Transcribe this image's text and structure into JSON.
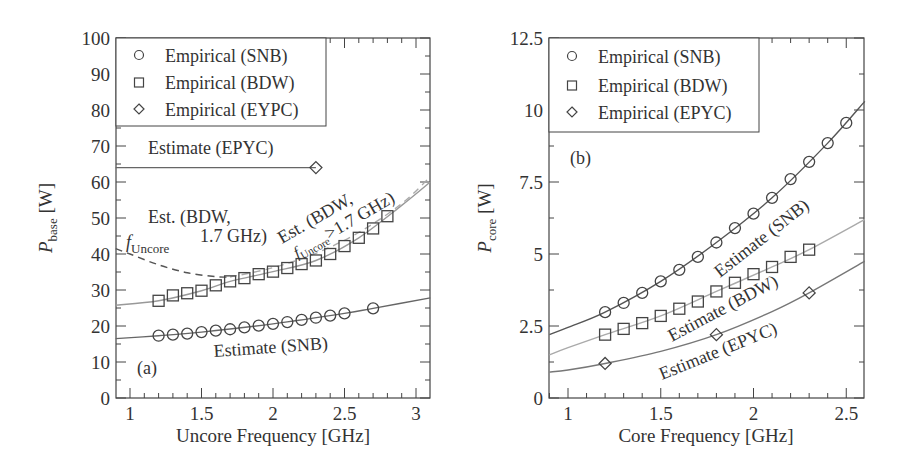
{
  "figure": {
    "panels": [
      "(a)",
      "(b)"
    ]
  },
  "chart_data": [
    {
      "type": "scatter",
      "panel_label": "(a)",
      "xlabel": "Uncore Frequency [GHz]",
      "ylabel": "P_base [W]",
      "ylabel_main": "P",
      "ylabel_sub": "base",
      "ylabel_unit": "[W]",
      "xlim": [
        0.9,
        3.1
      ],
      "ylim": [
        0,
        100
      ],
      "xticks": [
        1,
        1.5,
        2,
        2.5,
        3
      ],
      "xtick_labels": [
        "1",
        "1.5",
        "2",
        "2.5",
        "3"
      ],
      "yticks": [
        0,
        10,
        20,
        30,
        40,
        50,
        60,
        70,
        80,
        90,
        100
      ],
      "ytick_labels": [
        "0",
        "10",
        "20",
        "30",
        "40",
        "50",
        "60",
        "70",
        "80",
        "90",
        "100"
      ],
      "grid": false,
      "legend": {
        "position": "upper-left",
        "entries": [
          {
            "marker": "circle",
            "label": "Empirical (SNB)"
          },
          {
            "marker": "square",
            "label": "Empirical (BDW)"
          },
          {
            "marker": "diamond",
            "label": "Empirical (EYPC)"
          }
        ]
      },
      "series": [
        {
          "name": "Empirical (SNB)",
          "marker": "circle",
          "x": [
            1.2,
            1.3,
            1.4,
            1.5,
            1.6,
            1.7,
            1.8,
            1.9,
            2.0,
            2.1,
            2.2,
            2.3,
            2.4,
            2.5,
            2.7
          ],
          "y": [
            17.3,
            17.6,
            17.9,
            18.3,
            18.7,
            19.1,
            19.6,
            20.1,
            20.6,
            21.1,
            21.7,
            22.3,
            22.9,
            23.5,
            24.9
          ]
        },
        {
          "name": "Empirical (BDW)",
          "marker": "square",
          "x": [
            1.2,
            1.3,
            1.4,
            1.5,
            1.6,
            1.7,
            1.8,
            1.9,
            2.0,
            2.1,
            2.2,
            2.3,
            2.4,
            2.5,
            2.6,
            2.7,
            2.8
          ],
          "y": [
            27.0,
            28.5,
            29.1,
            29.8,
            31.3,
            32.4,
            33.3,
            34.4,
            35.1,
            36.1,
            37.2,
            38.2,
            40.0,
            42.2,
            44.5,
            47.1,
            50.5
          ]
        },
        {
          "name": "Empirical (EYPC)",
          "marker": "diamond",
          "x": [
            2.3
          ],
          "y": [
            64
          ]
        },
        {
          "name": "Estimate (SNB)",
          "style": "solid",
          "color": "#666666",
          "x": [
            0.9,
            1.2,
            1.5,
            2.0,
            2.5,
            2.7,
            3.1
          ],
          "y": [
            16.5,
            17.3,
            18.3,
            20.6,
            23.5,
            24.9,
            27.8
          ]
        },
        {
          "name": "Est. (BDW, > 1.7 GHz) fit",
          "style": "solid-light",
          "color": "#999999",
          "x": [
            0.9,
            1.2,
            1.5,
            1.7,
            2.0,
            2.3,
            2.6,
            2.9,
            3.1
          ],
          "y": [
            25.8,
            27.0,
            29.8,
            32.4,
            35.1,
            38.2,
            44.5,
            53.5,
            60.0
          ]
        },
        {
          "name": "Est. (BDW, <= 1.7 GHz) dashed",
          "style": "dashed",
          "color": "#555555",
          "x": [
            0.9,
            1.0,
            1.2,
            1.4,
            1.6,
            1.7
          ],
          "y": [
            41.5,
            40.0,
            37.0,
            34.8,
            33.7,
            33.6
          ]
        },
        {
          "name": "Est. (BDW, > 1.7 GHz) dashed",
          "style": "dashed-light",
          "color": "#aaaaaa",
          "x": [
            1.7,
            2.0,
            2.3,
            2.6,
            2.9,
            3.1
          ],
          "y": [
            33.6,
            36.2,
            40.2,
            46.0,
            54.0,
            61.5
          ]
        },
        {
          "name": "Estimate (EPYC)",
          "style": "solid",
          "color": "#666666",
          "x": [
            0.9,
            2.3
          ],
          "y": [
            64,
            64
          ]
        }
      ],
      "annotations": [
        {
          "text": "Estimate (EPYC)",
          "x": 1.5,
          "y": 69
        },
        {
          "text": "Est. (BDW,",
          "x": 1.5,
          "y": 48
        },
        {
          "text": "1.7 GHz)",
          "x": 1.6,
          "y": 43
        },
        {
          "text": "f_Uncore",
          "x": 1.05,
          "y": 43
        },
        {
          "text": "Est. (BDW, >1.7 GHz) f_Uncore",
          "x": 2.5,
          "y": 50,
          "rotation": -30
        },
        {
          "text": "Estimate (SNB)",
          "x": 2.0,
          "y": 13
        }
      ],
      "labels": {
        "est_epyc": "Estimate (EPYC)",
        "est_bdw_low_1": "Est. (BDW,",
        "est_bdw_low_2": "1.7 GHz)",
        "f_main": "f",
        "f_sub": "Uncore",
        "est_bdw_high_1": "Est. (BDW,",
        "est_bdw_high_2": ">1.7 GHz)",
        "est_snb": "Estimate (SNB)"
      }
    },
    {
      "type": "scatter",
      "panel_label": "(b)",
      "xlabel": "Core Frequency [GHz]",
      "ylabel": "P_core [W]",
      "ylabel_main": "P",
      "ylabel_sub": "core",
      "ylabel_unit": "[W]",
      "xlim": [
        0.9,
        2.6
      ],
      "ylim": [
        0,
        12.5
      ],
      "xticks": [
        1,
        1.5,
        2,
        2.5
      ],
      "xtick_labels": [
        "1",
        "1.5",
        "2",
        "2.5"
      ],
      "yticks": [
        0,
        2.5,
        5,
        7.5,
        10,
        12.5
      ],
      "ytick_labels": [
        "0",
        "2.5",
        "5",
        "7.5",
        "10",
        "12.5"
      ],
      "grid": false,
      "legend": {
        "position": "upper-left",
        "entries": [
          {
            "marker": "circle",
            "label": "Empirical (SNB)"
          },
          {
            "marker": "square",
            "label": "Empirical (BDW)"
          },
          {
            "marker": "diamond",
            "label": "Empirical (EPYC)"
          }
        ]
      },
      "series": [
        {
          "name": "Empirical (SNB)",
          "marker": "circle",
          "x": [
            1.2,
            1.3,
            1.4,
            1.5,
            1.6,
            1.7,
            1.8,
            1.9,
            2.0,
            2.1,
            2.2,
            2.3,
            2.4,
            2.5
          ],
          "y": [
            2.98,
            3.3,
            3.65,
            4.05,
            4.45,
            4.9,
            5.4,
            5.9,
            6.4,
            6.95,
            7.6,
            8.2,
            8.85,
            9.55
          ]
        },
        {
          "name": "Empirical (BDW)",
          "marker": "square",
          "x": [
            1.2,
            1.3,
            1.4,
            1.5,
            1.6,
            1.7,
            1.8,
            1.9,
            2.0,
            2.1,
            2.2,
            2.3
          ],
          "y": [
            2.2,
            2.4,
            2.6,
            2.85,
            3.1,
            3.35,
            3.7,
            4.0,
            4.3,
            4.55,
            4.9,
            5.15
          ]
        },
        {
          "name": "Empirical (EPYC)",
          "marker": "diamond",
          "x": [
            1.2,
            1.8,
            2.3
          ],
          "y": [
            1.2,
            2.2,
            3.65
          ]
        },
        {
          "name": "Estimate (SNB)",
          "style": "solid",
          "color": "#555555",
          "x": [
            0.9,
            1.0,
            1.2,
            1.5,
            1.8,
            2.1,
            2.4,
            2.6
          ],
          "y": [
            2.2,
            2.45,
            2.98,
            4.05,
            5.4,
            6.95,
            8.85,
            10.3
          ]
        },
        {
          "name": "Estimate (BDW)",
          "style": "solid-light",
          "color": "#aaaaaa",
          "x": [
            0.9,
            1.0,
            1.2,
            1.5,
            1.8,
            2.1,
            2.3,
            2.6
          ],
          "y": [
            1.5,
            1.75,
            2.2,
            2.85,
            3.7,
            4.55,
            5.15,
            6.2
          ]
        },
        {
          "name": "Estimate (EPYC)",
          "style": "solid",
          "color": "#777777",
          "x": [
            0.9,
            1.0,
            1.2,
            1.5,
            1.8,
            2.1,
            2.3,
            2.6
          ],
          "y": [
            0.9,
            0.97,
            1.2,
            1.62,
            2.2,
            3.0,
            3.65,
            4.75
          ]
        }
      ],
      "annotations": [
        {
          "text": "(b)",
          "x": 1.05,
          "y": 8.7
        },
        {
          "text": "Estimate (SNB)",
          "x": 1.55,
          "y": 6.0,
          "rotation": -38
        },
        {
          "text": "Estimate (BDW)",
          "x": 1.95,
          "y": 3.3,
          "rotation": -30
        },
        {
          "text": "Estimate (EPYC)",
          "x": 2.0,
          "y": 1.6,
          "rotation": -22
        }
      ],
      "labels": {
        "est_snb": "Estimate (SNB)",
        "est_bdw": "Estimate (BDW)",
        "est_epyc": "Estimate (EPYC)"
      }
    }
  ]
}
